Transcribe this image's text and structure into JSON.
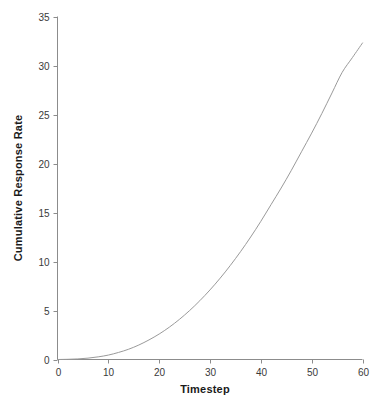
{
  "chart_data": {
    "type": "line",
    "title": "",
    "subtitle": "",
    "xlabel": "Timestep",
    "ylabel": "Cumulative Response Rate",
    "xlim": [
      0,
      60
    ],
    "ylim": [
      0,
      35
    ],
    "xticks": [
      0,
      10,
      20,
      30,
      40,
      50,
      60
    ],
    "yticks": [
      0,
      5,
      10,
      15,
      20,
      25,
      30,
      35
    ],
    "xtick_labels": [
      "0",
      "10",
      "20",
      "30",
      "40",
      "50",
      "60"
    ],
    "ytick_labels": [
      "0",
      "5",
      "10",
      "15",
      "20",
      "25",
      "30",
      "35"
    ],
    "grid": false,
    "legend": "none",
    "annotations": [],
    "line_color": "#9a9a9a",
    "axis_color": "#8c8c8c",
    "background_color": "#ffffff",
    "series": [
      {
        "name": "Cumulative Response Rate",
        "x": [
          0,
          2,
          4,
          6,
          8,
          10,
          12,
          14,
          16,
          18,
          20,
          22,
          24,
          26,
          28,
          30,
          32,
          34,
          36,
          38,
          40,
          42,
          44,
          46,
          48,
          50,
          52,
          54,
          56,
          58,
          60
        ],
        "values": [
          0.0,
          0.02,
          0.06,
          0.14,
          0.27,
          0.45,
          0.72,
          1.05,
          1.48,
          2.0,
          2.6,
          3.3,
          4.1,
          5.0,
          6.0,
          7.1,
          8.3,
          9.6,
          11.0,
          12.5,
          14.1,
          15.8,
          17.5,
          19.3,
          21.2,
          23.1,
          25.1,
          27.2,
          29.3,
          30.8,
          32.3
        ]
      }
    ]
  },
  "axes": {
    "x_title": "Timestep",
    "y_title": "Cumulative Response Rate"
  }
}
